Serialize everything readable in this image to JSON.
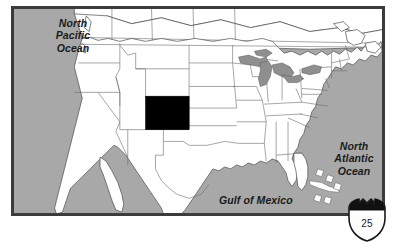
{
  "figure": {
    "kind": "locator-map"
  },
  "map": {
    "background_ocean_color": "#a8a8a8",
    "land_color": "#ffffff",
    "border_color": "#3b3b3b",
    "lake_color": "#8f8f8f",
    "highlight_color": "#000000",
    "highlighted_state": "Colorado",
    "labels": {
      "north_pacific_ocean": "North\nPacific\nOcean",
      "north_pacific_ocean_lines": [
        "North",
        "Pacific",
        "Ocean"
      ],
      "north_atlantic_ocean_lines": [
        "North",
        "Atlantic",
        "Ocean"
      ],
      "gulf_of_mexico": "Gulf of Mexico"
    }
  },
  "shield": {
    "name": "interstate-shield",
    "route_number": "25",
    "band_color": "#000000",
    "outline_color": "#1a1a1a",
    "fill_color": "#ffffff"
  }
}
